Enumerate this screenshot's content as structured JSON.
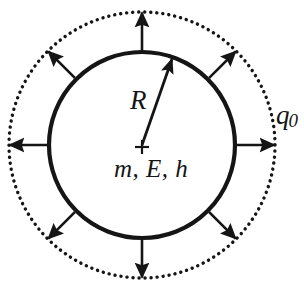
{
  "figure": {
    "background_color": "#ffffff",
    "ink_color": "#151515",
    "canvas": {
      "width": 304,
      "height": 288
    },
    "center": {
      "x": 142,
      "y": 145
    },
    "inner_circle": {
      "name": "solid-sphere-boundary",
      "radius": 93,
      "stroke_width": 4,
      "style": "solid"
    },
    "outer_circle": {
      "name": "dotted-charge-shell",
      "radius": 133,
      "style": "dotted",
      "dot_radius": 1.7,
      "dot_count": 140
    },
    "radial_arrows": {
      "name": "outward-flux-arrows",
      "count": 8,
      "angles_deg": [
        0,
        45,
        90,
        135,
        180,
        225,
        270,
        315
      ],
      "tail_radius": 95,
      "tip_radius": 133,
      "stroke_width": 2.6,
      "head_length": 15,
      "head_width": 16
    },
    "radius_arrow": {
      "name": "radius-indicator-arrow",
      "from": {
        "x": 142,
        "y": 145
      },
      "to": {
        "x": 173,
        "y": 58
      },
      "angle_deg": 70,
      "stroke_width": 2.8,
      "head_length": 17,
      "head_width": 13
    },
    "center_marker": {
      "name": "center-cross-marker",
      "arm_length": 7,
      "stroke_width": 2.2
    }
  },
  "labels": {
    "radius": "R",
    "center_quantities": "m, E, h",
    "charge_symbol": "q",
    "charge_subscript": "0"
  }
}
